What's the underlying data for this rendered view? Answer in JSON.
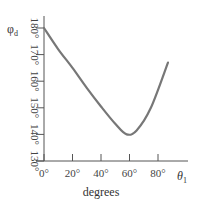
{
  "chart_data": {
    "type": "line",
    "title": "",
    "xlabel": "degrees",
    "x_symbol": "θ",
    "x_symbol_sub": "1",
    "ylabel_symbol": "φ",
    "ylabel_symbol_sub": "d",
    "xlim": [
      0,
      90
    ],
    "ylim": [
      130,
      180
    ],
    "x_ticks": [
      0,
      20,
      40,
      60,
      80
    ],
    "x_tick_labels": [
      "0°",
      "20°",
      "40°",
      "60°",
      "80°"
    ],
    "y_ticks": [
      130,
      140,
      150,
      160,
      170,
      180
    ],
    "y_tick_labels": [
      "130°",
      "140°",
      "150°",
      "160°",
      "170°",
      "180°"
    ],
    "grid": false,
    "legend": null,
    "series": [
      {
        "name": "φd vs θ1",
        "color": "#777777",
        "x": [
          0,
          10,
          20,
          30,
          40,
          50,
          58,
          65,
          75,
          87
        ],
        "y": [
          180,
          172,
          165,
          157.5,
          150.5,
          144,
          140,
          141.5,
          150,
          167
        ]
      }
    ]
  },
  "colors": {
    "axis": "#555555",
    "curve": "#777777"
  }
}
